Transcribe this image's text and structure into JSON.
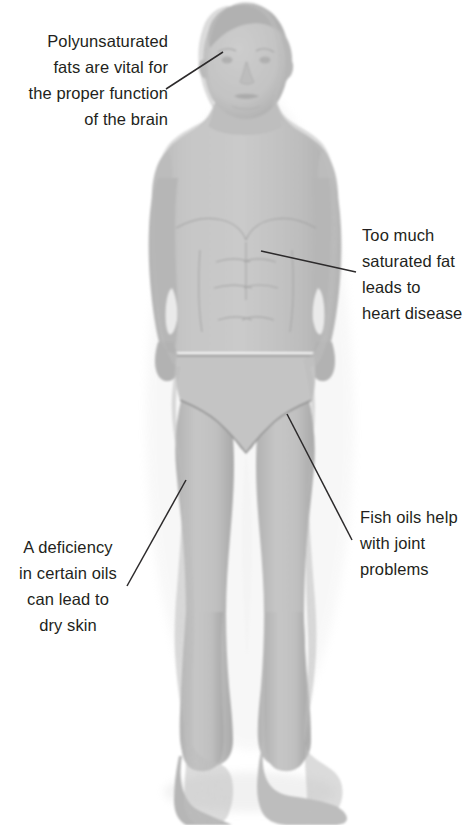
{
  "image": {
    "kind": "clay-model-human-figure-diagram",
    "subject": "Grey plasticine / clay model of a standing male human figure wearing briefs, front view, feet turned to the right",
    "background_color": "#ffffff",
    "body_color": "#c2c2c2",
    "body_shadow_color": "#a9a9a9",
    "outline_color": "#9a9a9a",
    "text_color": "#231f20",
    "leader_line_color": "#2c2a2b"
  },
  "callouts": [
    {
      "id": "brain",
      "name": "callout-brain",
      "align": "right",
      "lines": [
        "Polyunsaturated",
        "fats are vital for",
        "the proper function",
        "of the brain"
      ],
      "points_to": "head / brain"
    },
    {
      "id": "saturated-fat",
      "name": "callout-saturated-fat",
      "align": "left",
      "lines": [
        "Too much",
        "saturated fat",
        "leads to",
        "heart disease"
      ],
      "points_to": "chest / heart"
    },
    {
      "id": "fish-oils",
      "name": "callout-fish-oils",
      "align": "left",
      "lines": [
        "Fish oils help",
        "with joint",
        "problems"
      ],
      "points_to": "hip / leg joint"
    },
    {
      "id": "dry-skin",
      "name": "callout-dry-skin",
      "align": "center",
      "lines": [
        "A deficiency",
        "in certain oils",
        "can lead to",
        "dry skin"
      ],
      "points_to": "thigh / skin"
    }
  ]
}
